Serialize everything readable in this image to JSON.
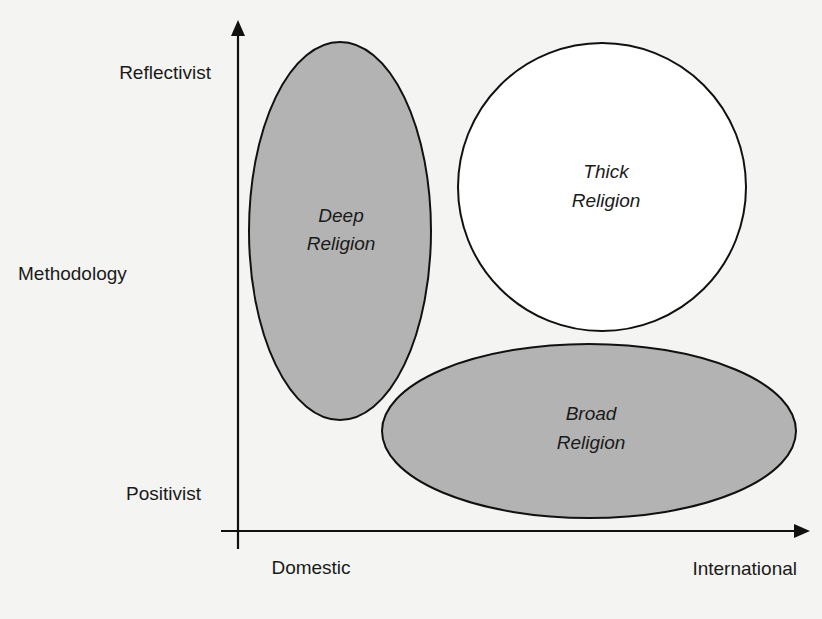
{
  "diagram": {
    "y_axis": {
      "title": "Methodology",
      "top_label": "Reflectivist",
      "bottom_label": "Positivist"
    },
    "x_axis": {
      "left_label": "Domestic",
      "right_label": "International"
    },
    "regions": [
      {
        "name": "deep-religion",
        "line1": "Deep",
        "line2": "Religion",
        "fill": "#b3b3b3",
        "stroke": "#111111"
      },
      {
        "name": "thick-religion",
        "line1": "Thick",
        "line2": "Religion",
        "fill": "#ffffff",
        "stroke": "#111111"
      },
      {
        "name": "broad-religion",
        "line1": "Broad",
        "line2": "Religion",
        "fill": "#b3b3b3",
        "stroke": "#111111"
      }
    ],
    "colors": {
      "axis": "#111111",
      "background": "#f4f4f2"
    }
  }
}
